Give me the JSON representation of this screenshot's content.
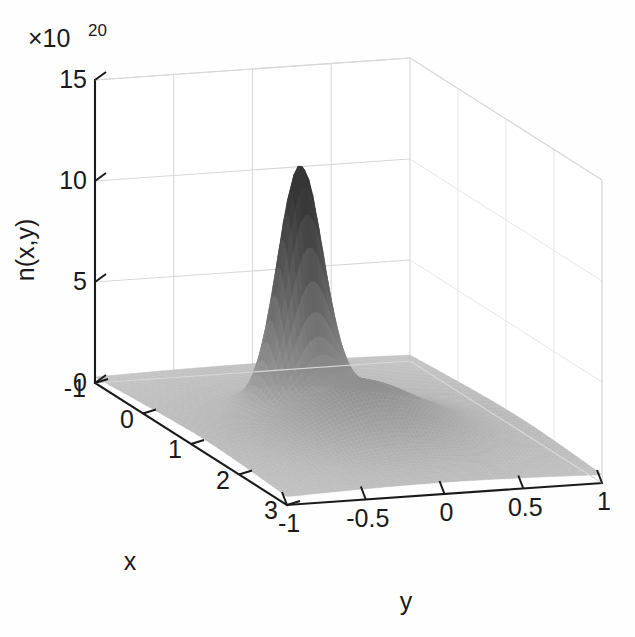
{
  "figure": {
    "background_color": "#fefefe",
    "axis_color": "#1a1a1a",
    "grid_color": "#d8d8d8"
  },
  "chart_data": {
    "type": "surface",
    "title": "",
    "xlabel": "x",
    "ylabel": "y",
    "zlabel": "n(x,y)",
    "exponent_label": "×10",
    "exponent_power": "20",
    "z_scale_factor": 1e+20,
    "xlim": [
      -1,
      3
    ],
    "ylim": [
      -1,
      1
    ],
    "zlim": [
      0,
      15
    ],
    "x_ticks": [
      -1,
      0,
      1,
      2,
      3
    ],
    "x_tick_labels": [
      "-1",
      "0",
      "1",
      "2",
      "3"
    ],
    "y_ticks": [
      -1,
      -0.5,
      0,
      0.5,
      1
    ],
    "y_tick_labels": [
      "-1",
      "-0.5",
      "0",
      "0.5",
      "1"
    ],
    "z_ticks": [
      0,
      5,
      10,
      15
    ],
    "z_tick_labels": [
      "0",
      "5",
      "10",
      "15"
    ],
    "grid": true,
    "legend": false,
    "colormap": "grayscale",
    "view": {
      "azimuth": -37.5,
      "elevation": 30
    },
    "components": [
      {
        "name": "narrow-peak",
        "amplitude": 11.3,
        "x0": 0.55,
        "y0": -0.17,
        "sx": 0.2,
        "sy": 0.13
      },
      {
        "name": "broad-bump",
        "amplitude": 2.2,
        "x0": 1.35,
        "y0": -0.02,
        "sx": 0.52,
        "sy": 0.34
      },
      {
        "name": "background-plateau",
        "amplitude": 0.85,
        "x0": 1.3,
        "y0": 0.0,
        "sx": 1.9,
        "sy": 1.25
      }
    ],
    "peak_value": 11.3,
    "secondary_peak_value": 2.2
  }
}
